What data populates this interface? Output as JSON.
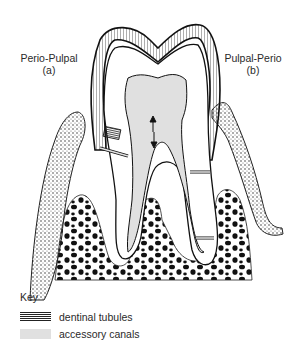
{
  "diagram": {
    "type": "dental cross-section",
    "labels": {
      "left": {
        "line1": "Perio-Pulpal",
        "line2": "(a)"
      },
      "right": {
        "line1": "Pulpal-Perio",
        "line2": "(b)"
      }
    },
    "key": {
      "title": "Key",
      "items": [
        {
          "label": "dentinal tubules",
          "pattern": "horizontal-lines"
        },
        {
          "label": "accessory canals",
          "pattern": "light-gray-fill"
        }
      ]
    },
    "colors": {
      "line": "#1a1a1a",
      "pulp": "#e0e0e0",
      "bone_spots": "#111111",
      "background": "#ffffff"
    }
  }
}
